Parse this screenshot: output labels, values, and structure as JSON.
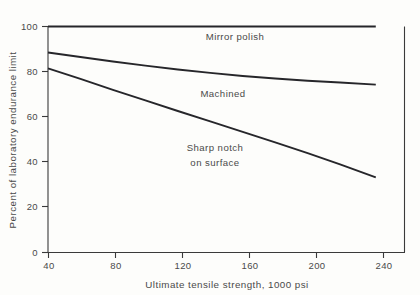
{
  "chart_data": {
    "type": "line",
    "title": "",
    "xlabel": "Ultimate tensile strength, 1000 psi",
    "ylabel": "Percent of laboratory endurance limit",
    "xlim": [
      40,
      260
    ],
    "ylim": [
      0,
      100
    ],
    "xticks": [
      40,
      80,
      120,
      160,
      200,
      240
    ],
    "yticks": [
      0,
      20,
      40,
      60,
      80,
      100
    ],
    "xtick_labels": [
      "40",
      "80",
      "120",
      "160",
      "200",
      "240"
    ],
    "ytick_labels": [
      "0",
      "20",
      "40",
      "60",
      "80",
      "100"
    ],
    "grid": false,
    "legend_position": "inline-annotations",
    "series": [
      {
        "name": "Mirror polish",
        "label": "Mirror polish",
        "label_x": 160,
        "label_y": 93,
        "points": [
          {
            "x": 40,
            "y": 100
          },
          {
            "x": 80,
            "y": 100
          },
          {
            "x": 120,
            "y": 100
          },
          {
            "x": 160,
            "y": 100
          },
          {
            "x": 200,
            "y": 100
          },
          {
            "x": 240,
            "y": 100
          },
          {
            "x": 242,
            "y": 100
          }
        ]
      },
      {
        "name": "Machined",
        "label": "Machined",
        "label_x": 152,
        "label_y": 74,
        "points": [
          {
            "x": 40,
            "y": 88.5
          },
          {
            "x": 60,
            "y": 86.5
          },
          {
            "x": 80,
            "y": 84.5
          },
          {
            "x": 100,
            "y": 82.7
          },
          {
            "x": 120,
            "y": 81.0
          },
          {
            "x": 140,
            "y": 79.5
          },
          {
            "x": 160,
            "y": 78.1
          },
          {
            "x": 180,
            "y": 77.0
          },
          {
            "x": 200,
            "y": 76.0
          },
          {
            "x": 220,
            "y": 75.2
          },
          {
            "x": 242,
            "y": 74.3
          }
        ]
      },
      {
        "name": "Sharp notch on surface",
        "label": "Sharp notch\non surface",
        "label_line1": "Sharp notch",
        "label_line2": "on surface",
        "label_x": 140,
        "label_y": 49,
        "points": [
          {
            "x": 40,
            "y": 81.5
          },
          {
            "x": 60,
            "y": 76.8
          },
          {
            "x": 80,
            "y": 72.0
          },
          {
            "x": 100,
            "y": 67.3
          },
          {
            "x": 120,
            "y": 62.6
          },
          {
            "x": 140,
            "y": 58.0
          },
          {
            "x": 160,
            "y": 53.4
          },
          {
            "x": 180,
            "y": 48.7
          },
          {
            "x": 200,
            "y": 44.0
          },
          {
            "x": 220,
            "y": 39.0
          },
          {
            "x": 242,
            "y": 33.2
          }
        ]
      }
    ]
  },
  "colors": {
    "background": "#fdfdfb",
    "axis": "#3a3a3a",
    "line": "#26262a",
    "text": "#4a4a4a"
  }
}
